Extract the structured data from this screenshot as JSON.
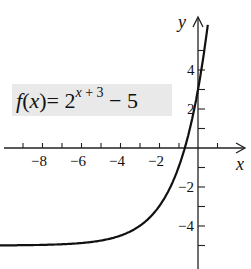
{
  "chart_data": {
    "type": "line",
    "function": {
      "prefix": "f(x)= 2",
      "exponent": "x + 3",
      "suffix": " − 5"
    },
    "xlabel": "x",
    "ylabel": "y",
    "xlim": [
      -10,
      1.5
    ],
    "ylim": [
      -5.8,
      6.2
    ],
    "x_ticks": [
      -9,
      -8,
      -7,
      -6,
      -5,
      -4,
      -3,
      -2,
      -1,
      1
    ],
    "x_tick_labels": [
      "-8",
      "-6",
      "-4",
      "-2"
    ],
    "y_ticks": [
      -5,
      -4,
      -3,
      -2,
      -1,
      1,
      2,
      3,
      4,
      5
    ],
    "y_tick_labels": [
      "4",
      "2",
      "-2",
      "-4"
    ],
    "asymptote": -5,
    "x": [
      -10,
      -9,
      -8,
      -7,
      -6,
      -5,
      -4,
      -3,
      -2,
      -1,
      -0.68,
      0,
      0.5
    ],
    "values": [
      -4.98,
      -4.97,
      -4.94,
      -4.88,
      -4.75,
      -4.5,
      -4,
      -3,
      -1,
      3,
      0,
      3,
      6.31
    ],
    "series": [
      {
        "name": "f(x)",
        "x": [
          -10,
          -9,
          -8,
          -7,
          -6,
          -5,
          -4,
          -3,
          -2,
          -1,
          -0.68,
          0,
          0.5
        ],
        "values": [
          -4.98,
          -4.97,
          -4.94,
          -4.88,
          -4.75,
          -4.5,
          -4,
          -3,
          -1,
          3,
          0,
          3,
          6.31
        ]
      }
    ],
    "grid": false,
    "legend": "none"
  },
  "labels": {
    "x_axis": "x",
    "y_axis": "y",
    "tick_m8": "−8",
    "tick_m6": "−6",
    "tick_m4": "−4",
    "tick_m2": "−2",
    "tick_y4": "4",
    "tick_y2": "2",
    "tick_ym2": "−2",
    "tick_ym4": "−4"
  }
}
